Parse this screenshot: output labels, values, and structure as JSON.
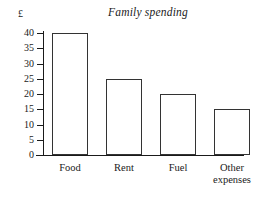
{
  "chart_data": {
    "type": "bar",
    "title": "Family spending",
    "xlabel": "",
    "ylabel": "£",
    "categories": [
      "Food",
      "Rent",
      "Fuel",
      "Other expenses"
    ],
    "category_labels_display": [
      "Food",
      "Rent",
      "Fuel",
      "Other\nexpenses"
    ],
    "values": [
      40,
      25,
      20,
      15
    ],
    "ylim": [
      0,
      40
    ],
    "yticks": [
      0,
      5,
      10,
      15,
      20,
      25,
      30,
      35,
      40
    ],
    "ytick_labels": [
      "0",
      "5",
      "10",
      "15",
      "20",
      "25",
      "30",
      "35",
      "40"
    ],
    "grid": false,
    "legend": null,
    "bar_fill_color": "#ffffff",
    "bar_edge_color": "#333333",
    "axis_color": "#1a1a1a"
  }
}
